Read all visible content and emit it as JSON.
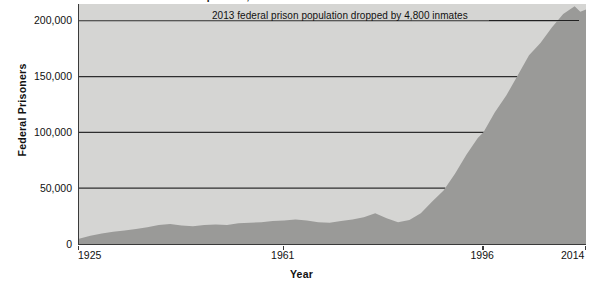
{
  "chart_data": {
    "type": "area",
    "title": "Federal Prison Population, 1925–2014",
    "xlabel": "Year",
    "ylabel": "Federal Prisoners",
    "xlim": [
      1925,
      2014
    ],
    "ylim": [
      0,
      215000
    ],
    "grid": true,
    "legend": false,
    "x_ticks": [
      "1925",
      "1961",
      "1996",
      "2014"
    ],
    "x_tick_values": [
      1925,
      1961,
      1996,
      2014
    ],
    "y_ticks": [
      "0",
      "50,000",
      "100,000",
      "150,000",
      "200,000"
    ],
    "y_tick_values": [
      0,
      50000,
      100000,
      150000,
      200000
    ],
    "annotations": [
      {
        "text": "2013 federal prison population dropped by 4,800 inmates",
        "leader_line": true
      }
    ],
    "series": [
      {
        "name": "Federal Prisoners",
        "fill_color": "#9a9a98",
        "x": [
          1925,
          1927,
          1929,
          1931,
          1933,
          1935,
          1937,
          1939,
          1941,
          1943,
          1945,
          1947,
          1949,
          1951,
          1953,
          1955,
          1957,
          1959,
          1961,
          1963,
          1965,
          1967,
          1969,
          1971,
          1973,
          1975,
          1977,
          1979,
          1981,
          1983,
          1985,
          1987,
          1989,
          1991,
          1993,
          1995,
          1996,
          1998,
          2000,
          2002,
          2004,
          2006,
          2008,
          2010,
          2012,
          2013,
          2014
        ],
        "values": [
          4800,
          7500,
          9500,
          11000,
          12000,
          13500,
          15000,
          17000,
          18000,
          16500,
          16000,
          17000,
          17500,
          17000,
          18500,
          19000,
          19500,
          20500,
          21000,
          22000,
          21000,
          19500,
          19000,
          20500,
          22000,
          24000,
          27500,
          23000,
          19500,
          21500,
          27500,
          38000,
          48000,
          63000,
          80000,
          95000,
          100000,
          118000,
          133000,
          151000,
          169000,
          180000,
          194000,
          206000,
          213000,
          208000,
          210000
        ]
      }
    ]
  },
  "axis": {
    "y_title": "Federal Prisoners",
    "x_title": "Year"
  },
  "colors": {
    "plot_background": "#d5d5d3",
    "area_fill": "#9a9a98",
    "gridline": "#2e2e2e",
    "axis_line": "#3a3a3a",
    "text": "#111111"
  }
}
